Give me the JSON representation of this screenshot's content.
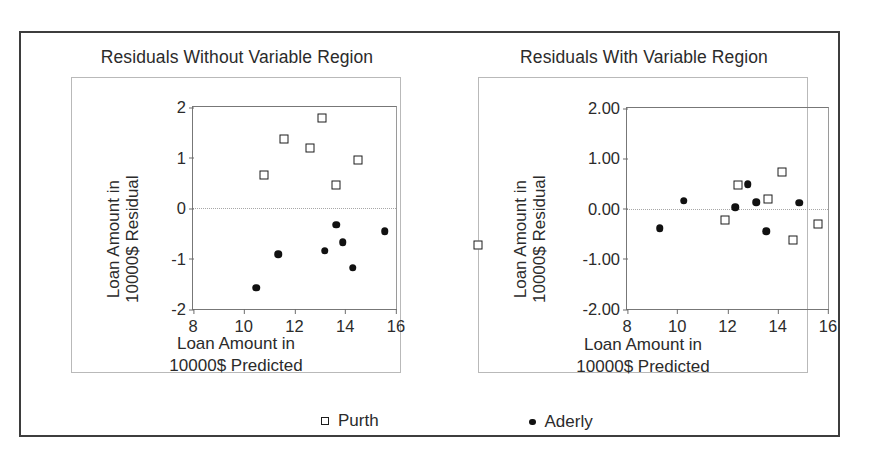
{
  "figure": {
    "legend": [
      {
        "name": "purth",
        "label": "Purth",
        "marker": "open-square",
        "color": "#1d1d1d"
      },
      {
        "name": "aderly",
        "label": "Aderly",
        "marker": "filled-circle",
        "color": "#111111"
      }
    ],
    "stray_marker": {
      "name": "orphan-purth-marker",
      "marker": "open-square"
    }
  },
  "chart_data": [
    {
      "type": "scatter",
      "title": "Residuals Without Variable Region",
      "xlabel": "Loan Amount in\n10000$ Predicted",
      "xlabel_line1": "Loan Amount in",
      "xlabel_line2": "10000$ Predicted",
      "ylabel_line1": "Loan Amount in",
      "ylabel_line2": "10000$ Residual",
      "xlim": [
        8,
        16
      ],
      "ylim": [
        -2,
        2
      ],
      "xticks": [
        "8",
        "10",
        "12",
        "14",
        "16"
      ],
      "xtick_values": [
        8,
        10,
        12,
        14,
        16
      ],
      "yticks": [
        "2",
        "1",
        "0",
        "-1",
        "-2"
      ],
      "ytick_values": [
        2,
        1,
        0,
        -1,
        -2
      ],
      "grid": false,
      "zero_reference_line": 0,
      "legend_position": "below-figure",
      "series": [
        {
          "name": "Purth",
          "marker": "open-square",
          "points": [
            [
              10.8,
              0.65
            ],
            [
              11.6,
              1.37
            ],
            [
              12.6,
              1.18
            ],
            [
              13.1,
              1.79
            ],
            [
              13.65,
              0.45
            ],
            [
              14.5,
              0.96
            ]
          ]
        },
        {
          "name": "Aderly",
          "marker": "filled-circle",
          "points": [
            [
              10.5,
              -1.58
            ],
            [
              11.35,
              -0.92
            ],
            [
              13.2,
              -0.85
            ],
            [
              13.65,
              -0.33
            ],
            [
              13.9,
              -0.68
            ],
            [
              14.3,
              -1.18
            ],
            [
              15.55,
              -0.46
            ]
          ]
        }
      ]
    },
    {
      "type": "scatter",
      "title": "Residuals With Variable Region",
      "xlabel": "Loan Amount in\n10000$ Predicted",
      "xlabel_line1": "Loan Amount in",
      "xlabel_line2": "10000$ Predicted",
      "ylabel_line1": "Loan Amount in",
      "ylabel_line2": "10000$ Residual",
      "xlim": [
        8,
        16
      ],
      "ylim": [
        -2,
        2
      ],
      "xticks": [
        "8",
        "10",
        "12",
        "14",
        "16"
      ],
      "xtick_values": [
        8,
        10,
        12,
        14,
        16
      ],
      "yticks": [
        "2.00",
        "1.00",
        "0.00",
        "-1.00",
        "-2.00"
      ],
      "ytick_values": [
        2,
        1,
        0,
        -1,
        -2
      ],
      "grid": false,
      "zero_reference_line": 0,
      "legend_position": "below-figure",
      "series": [
        {
          "name": "Purth",
          "marker": "open-square",
          "points": [
            [
              11.9,
              -0.23
            ],
            [
              12.4,
              0.47
            ],
            [
              13.6,
              0.19
            ],
            [
              14.15,
              0.73
            ],
            [
              14.6,
              -0.63
            ],
            [
              15.6,
              -0.3
            ]
          ]
        },
        {
          "name": "Aderly",
          "marker": "filled-circle",
          "points": [
            [
              9.3,
              -0.39
            ],
            [
              10.25,
              0.15
            ],
            [
              12.3,
              0.02
            ],
            [
              12.8,
              0.48
            ],
            [
              13.15,
              0.12
            ],
            [
              13.55,
              -0.45
            ],
            [
              14.85,
              0.11
            ]
          ]
        }
      ]
    }
  ]
}
